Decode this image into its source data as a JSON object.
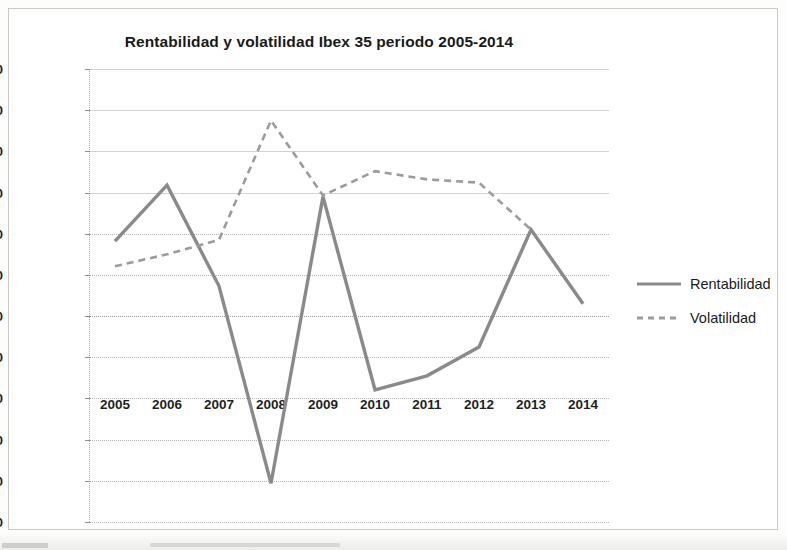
{
  "chart_data": {
    "type": "line",
    "title": "Rentabilidad y volatilidad Ibex 35 periodo 2005-2014",
    "xlabel": "",
    "ylabel": "",
    "categories": [
      "2005",
      "2006",
      "2007",
      "2008",
      "2009",
      "2010",
      "2011",
      "2012",
      "2013",
      "2014"
    ],
    "series": [
      {
        "name": "Rentabilidad",
        "style": "solid",
        "color": "#8a8a8a",
        "values": [
          18.2,
          31.8,
          7.3,
          -40.6,
          29.0,
          -17.9,
          -14.5,
          -7.5,
          21.0,
          3.0
        ]
      },
      {
        "name": "Volatilidad",
        "style": "dashed",
        "color": "#9b9b9b",
        "values": [
          12.1,
          15.0,
          18.5,
          47.5,
          29.3,
          35.2,
          33.2,
          32.4,
          21.0,
          null
        ]
      }
    ],
    "ylim": [
      -50,
      60
    ],
    "ytick_step": 10,
    "ytick_labels": [
      "60,00",
      "50,00",
      "40,00",
      "30,00",
      "20,00",
      "10,00",
      "0,00",
      "-10,00",
      "-20,00",
      "-30,00",
      "-40,00",
      "-50,00"
    ],
    "ytick_values": [
      60,
      50,
      40,
      30,
      20,
      10,
      0,
      -10,
      -20,
      -30,
      -40,
      -50
    ],
    "grid": true,
    "legend_position": "right",
    "legend": [
      "Rentabilidad",
      "Volatilidad"
    ],
    "decimal_separator": ","
  },
  "legend": {
    "items": [
      {
        "label": "Rentabilidad",
        "style": "solid"
      },
      {
        "label": "Volatilidad",
        "style": "dashed"
      }
    ]
  },
  "colors": {
    "series_rentabilidad": "#8a8a8a",
    "series_volatilidad": "#9b9b9b",
    "grid": "#b5b5b5",
    "frame": "#c9c9c9",
    "text": "#1a1a1a"
  }
}
